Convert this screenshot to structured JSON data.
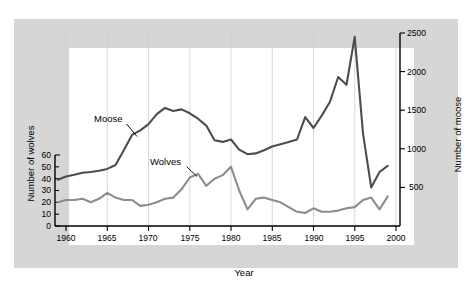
{
  "chart_data": {
    "type": "line",
    "title": "",
    "subtitle": "",
    "xlabel": "Year",
    "ylabel": "Number of wolves",
    "ylabel_right": "Number of moose",
    "xlim": [
      1959,
      2000
    ],
    "ylim_left": [
      0,
      60
    ],
    "ylim_right": [
      0,
      2500
    ],
    "xticks": [
      1960,
      1965,
      1970,
      1975,
      1980,
      1985,
      1990,
      1995,
      2000
    ],
    "xticklabels": [
      "1960",
      "1965",
      "1970",
      "1975",
      "1980",
      "1985",
      "1990",
      "1995",
      "2000"
    ],
    "yticks_left": [
      0,
      10,
      20,
      30,
      40,
      50,
      60
    ],
    "yticklabels_left": [
      "0",
      "10",
      "20",
      "30",
      "40",
      "50",
      "60"
    ],
    "yticks_right": [
      500,
      1000,
      1500,
      2000,
      2500
    ],
    "yticklabels_right": [
      "500",
      "1000",
      "1500",
      "2000",
      "2500"
    ],
    "grid": "vertical",
    "legend_position": "inline-annotation",
    "annotations": [
      {
        "text": "Moose",
        "x": 1968.0,
        "y": 1560
      },
      {
        "text": "Wolves",
        "x": 1975.4,
        "y": 790
      }
    ],
    "series": [
      {
        "name": "Moose",
        "axis": "right",
        "color": "#4d4d4d",
        "x": [
          1959,
          1960,
          1961,
          1962,
          1963,
          1964,
          1965,
          1966,
          1967,
          1968,
          1969,
          1970,
          1971,
          1972,
          1973,
          1974,
          1975,
          1976,
          1977,
          1978,
          1979,
          1980,
          1981,
          1982,
          1983,
          1984,
          1985,
          1986,
          1987,
          1988,
          1989,
          1990,
          1991,
          1992,
          1993,
          1994,
          1995,
          1996,
          1997,
          1998,
          1999
        ],
        "values": [
          600,
          640,
          665,
          690,
          700,
          715,
          740,
          790,
          980,
          1180,
          1240,
          1320,
          1450,
          1530,
          1490,
          1510,
          1460,
          1390,
          1300,
          1110,
          1090,
          1120,
          990,
          930,
          940,
          980,
          1030,
          1060,
          1090,
          1120,
          1410,
          1270,
          1430,
          1610,
          1930,
          1830,
          2450,
          1200,
          500,
          700,
          780
        ]
      },
      {
        "name": "Wolves",
        "axis": "left",
        "color": "#8c8c8c",
        "x": [
          1959,
          1960,
          1961,
          1962,
          1963,
          1964,
          1965,
          1966,
          1967,
          1968,
          1969,
          1970,
          1971,
          1972,
          1973,
          1974,
          1975,
          1976,
          1977,
          1978,
          1979,
          1980,
          1981,
          1982,
          1983,
          1984,
          1985,
          1986,
          1987,
          1988,
          1989,
          1990,
          1991,
          1992,
          1993,
          1994,
          1995,
          1996,
          1997,
          1998,
          1999
        ],
        "values": [
          20,
          22,
          22,
          23,
          20,
          23,
          28,
          24,
          22,
          22,
          17,
          18,
          20,
          23,
          24,
          31,
          41,
          44,
          34,
          40,
          43,
          50,
          30,
          14,
          23,
          24,
          22,
          20,
          16,
          12,
          11,
          15,
          12,
          12,
          13,
          15,
          16,
          22,
          24,
          14,
          25
        ]
      }
    ]
  },
  "axes": {
    "left_title": "Number of wolves",
    "right_title": "Number of moose",
    "x_title": "Year"
  }
}
